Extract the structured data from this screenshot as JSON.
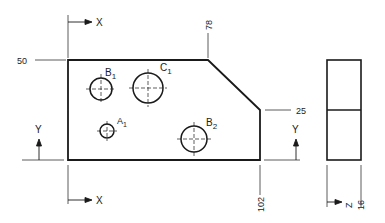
{
  "drawing": {
    "front_view": {
      "dims": {
        "top": "50",
        "chamfer_start": "78",
        "chamfer_end": "25",
        "width": "102"
      },
      "axes": {
        "x_top": "X",
        "x_bottom": "X",
        "y_left": "Y",
        "y_right": "Y"
      },
      "holes": [
        {
          "label": "B",
          "sub": "1"
        },
        {
          "label": "C",
          "sub": "1"
        },
        {
          "label": "A",
          "sub": "1"
        },
        {
          "label": "B",
          "sub": "2"
        }
      ]
    },
    "side_view": {
      "axis": "Z",
      "depth": "16"
    },
    "colors": {
      "line": "#1a1a1a",
      "thin": "#444444"
    }
  }
}
